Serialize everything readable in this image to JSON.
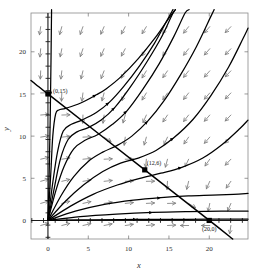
{
  "figure": {
    "kind": "phase-portrait",
    "background_color": "#ffffff",
    "frame_color": "#8a8a8a",
    "curve_color": "#000000",
    "field_color": "#7d7d7d"
  },
  "axes": {
    "x_title": "x",
    "y_title": "y",
    "x_ticks": [
      "0",
      "5",
      "10",
      "15",
      "20"
    ],
    "y_ticks": [
      "0",
      "5",
      "10",
      "15",
      "20"
    ],
    "x_tick_values": [
      0,
      5,
      10,
      15,
      20
    ],
    "y_tick_values": [
      0,
      5,
      10,
      15,
      20
    ],
    "xlim": [
      -2.1,
      24.8
    ],
    "ylim": [
      -2.2,
      24.6
    ],
    "grid": false
  },
  "annotations": [
    {
      "label": "(0,15)",
      "x": 0,
      "y": 15
    },
    {
      "label": "(12,6)",
      "x": 12,
      "y": 6
    },
    {
      "label": "(20,0)",
      "x": 20,
      "y": 0
    }
  ],
  "chart_data": {
    "type": "line",
    "title": "",
    "xlabel": "x",
    "ylabel": "y",
    "xlim": [
      -2.1,
      24.8
    ],
    "ylim": [
      -2.2,
      24.6
    ],
    "grid": false,
    "legend": "none",
    "equilibria": [
      {
        "name": "(0,15)",
        "x": 0,
        "y": 15,
        "marker": "filled-square"
      },
      {
        "name": "(12,6)",
        "x": 12,
        "y": 6,
        "marker": "filled-square"
      },
      {
        "name": "(20,0)",
        "x": 20,
        "y": 0,
        "marker": "filled-square"
      }
    ],
    "nullcline": {
      "name": "nullcline-through-equilibria",
      "points": [
        [
          -2.1,
          16.6
        ],
        [
          0,
          15
        ],
        [
          12,
          6
        ],
        [
          20,
          0
        ],
        [
          22.9,
          -2.2
        ]
      ]
    },
    "trajectories": [
      {
        "name": "traj-1",
        "points": [
          [
            0,
            0
          ],
          [
            0.35,
            5.5
          ],
          [
            0.6,
            10.0
          ],
          [
            0.95,
            12.6
          ],
          [
            1.35,
            13.1
          ],
          [
            2.2,
            13.3
          ],
          [
            4.0,
            13.9
          ],
          [
            6.0,
            14.9
          ],
          [
            7.2,
            15.6
          ],
          [
            9.0,
            17.0
          ],
          [
            11.2,
            19.2
          ],
          [
            13.4,
            21.8
          ],
          [
            15.0,
            24.0
          ],
          [
            15.8,
            25.0
          ]
        ]
      },
      {
        "name": "traj-2",
        "points": [
          [
            0,
            0
          ],
          [
            0.6,
            4.5
          ],
          [
            1.2,
            8.2
          ],
          [
            1.9,
            10.6
          ],
          [
            2.9,
            11.4
          ],
          [
            4.2,
            11.9
          ],
          [
            6.0,
            12.8
          ],
          [
            7.6,
            14.0
          ],
          [
            9.4,
            15.9
          ],
          [
            11.4,
            18.4
          ],
          [
            13.2,
            21.0
          ],
          [
            14.8,
            23.8
          ],
          [
            15.5,
            25.0
          ]
        ]
      },
      {
        "name": "traj-3",
        "points": [
          [
            0,
            0
          ],
          [
            1.0,
            3.6
          ],
          [
            2.0,
            6.4
          ],
          [
            3.2,
            8.5
          ],
          [
            4.6,
            9.5
          ],
          [
            6.2,
            10.2
          ],
          [
            8.0,
            11.4
          ],
          [
            9.8,
            13.0
          ],
          [
            11.8,
            15.6
          ],
          [
            13.8,
            18.6
          ],
          [
            15.6,
            21.8
          ],
          [
            17.0,
            24.6
          ],
          [
            17.5,
            25.0
          ]
        ]
      },
      {
        "name": "traj-4",
        "points": [
          [
            0,
            0
          ],
          [
            1.6,
            2.9
          ],
          [
            3.2,
            5.2
          ],
          [
            5.0,
            7.0
          ],
          [
            6.8,
            8.1
          ],
          [
            8.6,
            8.9
          ],
          [
            10.4,
            10.0
          ],
          [
            12.4,
            11.8
          ],
          [
            14.4,
            14.2
          ],
          [
            16.4,
            17.2
          ],
          [
            18.4,
            20.6
          ],
          [
            20.2,
            24.2
          ],
          [
            20.6,
            25.0
          ]
        ]
      },
      {
        "name": "traj-5",
        "points": [
          [
            0,
            0
          ],
          [
            2.2,
            2.3
          ],
          [
            4.4,
            4.2
          ],
          [
            6.8,
            5.8
          ],
          [
            9.0,
            6.8
          ],
          [
            11.2,
            7.4
          ],
          [
            13.4,
            8.3
          ],
          [
            15.6,
            9.8
          ],
          [
            18.0,
            12.0
          ],
          [
            20.2,
            14.8
          ],
          [
            22.4,
            18.2
          ],
          [
            24.2,
            21.6
          ],
          [
            24.8,
            22.8
          ]
        ]
      },
      {
        "name": "traj-6",
        "points": [
          [
            0,
            0
          ],
          [
            2.8,
            1.7
          ],
          [
            5.6,
            3.1
          ],
          [
            8.6,
            4.2
          ],
          [
            11.4,
            5.0
          ],
          [
            14.0,
            5.6
          ],
          [
            16.6,
            6.3
          ],
          [
            19.2,
            7.4
          ],
          [
            21.6,
            9.0
          ],
          [
            23.8,
            10.9
          ],
          [
            24.8,
            11.9
          ]
        ]
      },
      {
        "name": "traj-7",
        "points": [
          [
            0,
            0
          ],
          [
            3.4,
            1.1
          ],
          [
            7.0,
            1.9
          ],
          [
            10.6,
            2.4
          ],
          [
            14.0,
            2.7
          ],
          [
            17.4,
            2.9
          ],
          [
            20.4,
            3.0
          ],
          [
            23.0,
            3.1
          ],
          [
            24.8,
            3.2
          ]
        ]
      },
      {
        "name": "traj-8",
        "points": [
          [
            0,
            0
          ],
          [
            4.0,
            0.45
          ],
          [
            8.5,
            0.75
          ],
          [
            13.0,
            0.95
          ],
          [
            17.5,
            1.05
          ],
          [
            21.5,
            1.1
          ],
          [
            24.8,
            1.1
          ]
        ]
      },
      {
        "name": "traj-9",
        "points": [
          [
            0,
            0
          ],
          [
            5.0,
            0.08
          ],
          [
            11.0,
            0.12
          ],
          [
            17.0,
            0.14
          ],
          [
            24.8,
            0.15
          ]
        ]
      },
      {
        "name": "traj-10",
        "points": [
          [
            0,
            0
          ],
          [
            0.12,
            4.0
          ],
          [
            0.2,
            8.0
          ],
          [
            0.28,
            12.0
          ],
          [
            0.33,
            15.5
          ],
          [
            0.38,
            19.0
          ],
          [
            0.42,
            22.5
          ],
          [
            0.45,
            25.0
          ]
        ]
      },
      {
        "name": "traj-11",
        "points": [
          [
            0,
            0
          ],
          [
            0.8,
            3.9
          ],
          [
            1.55,
            7.3
          ],
          [
            2.5,
            9.6
          ],
          [
            3.6,
            10.5
          ],
          [
            5.0,
            11.0
          ],
          [
            6.6,
            11.9
          ],
          [
            8.3,
            13.4
          ],
          [
            10.2,
            15.8
          ],
          [
            12.2,
            18.7
          ],
          [
            14.0,
            21.6
          ],
          [
            15.4,
            24.4
          ],
          [
            15.8,
            25.0
          ]
        ]
      }
    ],
    "vector_field": {
      "description": "arrows point down / down-left above the nullcline and right / left toward the nullcline below it",
      "grid_spacing_x": 2.6,
      "grid_spacing_y": 2.6,
      "directions_note": "upper region: down and down-left; right region: left; lower-left region: right and up-right"
    }
  }
}
